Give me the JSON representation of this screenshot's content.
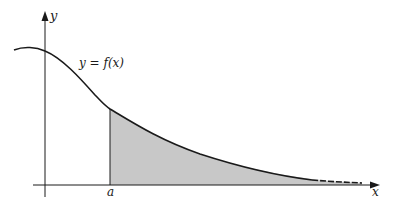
{
  "diagram": {
    "type": "function-area-under-curve",
    "curve_label": "y = f(x)",
    "x_axis_label": "x",
    "y_axis_label": "y",
    "point_label": "a",
    "shaded_region": "area under y = f(x) from x = a to infinity",
    "colors": {
      "curve": "#1a1a1a",
      "axes": "#1a1a1a",
      "fill": "#c8c8c8"
    }
  }
}
